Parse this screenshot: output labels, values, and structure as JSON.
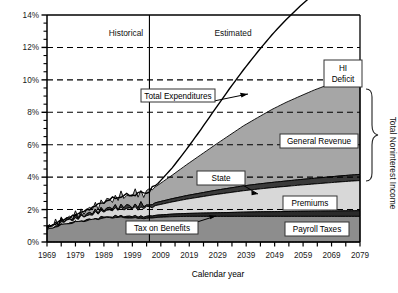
{
  "chart_data": {
    "type": "area",
    "title": "",
    "xlabel": "Calendar year",
    "ylabel": "",
    "xlim": [
      1969,
      2079
    ],
    "ylim": [
      0,
      14
    ],
    "ytick_labels": [
      "0%",
      "2%",
      "4%",
      "6%",
      "8%",
      "10%",
      "12%",
      "14%"
    ],
    "ytick_values": [
      0,
      2,
      4,
      6,
      8,
      10,
      12,
      14
    ],
    "yminor_step": 0.5,
    "xtick_labels": [
      "1969",
      "1979",
      "1989",
      "1999",
      "2009",
      "2019",
      "2029",
      "2039",
      "2049",
      "2059",
      "2069",
      "2079"
    ],
    "xtick_values": [
      1969,
      1979,
      1989,
      1999,
      2009,
      2019,
      2029,
      2039,
      2049,
      2059,
      2069,
      2079
    ],
    "xminor_step": 5,
    "grid": "horizontal-dashed",
    "legend_position": "inline-callouts",
    "divider_year": 2005,
    "periods": [
      {
        "label": "Historical",
        "x": 1987
      },
      {
        "label": "Estimated",
        "x": 2022
      }
    ],
    "x": [
      1969,
      1974,
      1979,
      1984,
      1989,
      1994,
      1999,
      2004,
      2008,
      2013,
      2018,
      2023,
      2028,
      2033,
      2038,
      2043,
      2048,
      2053,
      2058,
      2063,
      2068,
      2073,
      2079
    ],
    "series": [
      {
        "name": "Payroll Taxes",
        "kind": "stacked-area",
        "color": "#8d8d8d",
        "values": [
          0.75,
          1.05,
          1.22,
          1.35,
          1.48,
          1.52,
          1.48,
          1.45,
          1.52,
          1.56,
          1.58,
          1.58,
          1.58,
          1.58,
          1.58,
          1.58,
          1.58,
          1.58,
          1.58,
          1.58,
          1.58,
          1.58,
          1.58
        ]
      },
      {
        "name": "Tax on Benefits",
        "kind": "stacked-area",
        "color": "#2a2a2a",
        "values": [
          0.0,
          0.0,
          0.0,
          0.02,
          0.05,
          0.07,
          0.1,
          0.12,
          0.14,
          0.16,
          0.18,
          0.2,
          0.22,
          0.24,
          0.26,
          0.28,
          0.29,
          0.3,
          0.31,
          0.32,
          0.33,
          0.34,
          0.35
        ]
      },
      {
        "name": "Premiums",
        "kind": "stacked-area",
        "color": "#d8d8d8",
        "values": [
          0.1,
          0.16,
          0.22,
          0.3,
          0.38,
          0.45,
          0.5,
          0.55,
          0.62,
          0.75,
          0.88,
          1.0,
          1.12,
          1.22,
          1.32,
          1.4,
          1.48,
          1.55,
          1.62,
          1.68,
          1.74,
          1.8,
          1.86
        ]
      },
      {
        "name": "State",
        "kind": "stacked-area",
        "color": "#3a3a3a",
        "values": [
          0.04,
          0.06,
          0.08,
          0.1,
          0.12,
          0.14,
          0.15,
          0.16,
          0.18,
          0.2,
          0.22,
          0.24,
          0.26,
          0.28,
          0.3,
          0.31,
          0.32,
          0.33,
          0.34,
          0.35,
          0.36,
          0.37,
          0.38
        ]
      },
      {
        "name": "General Revenue",
        "kind": "stacked-area",
        "color": "#a6a6a6",
        "values": [
          0.0,
          0.05,
          0.15,
          0.28,
          0.45,
          0.6,
          0.7,
          0.78,
          1.05,
          1.45,
          1.9,
          2.35,
          2.8,
          3.25,
          3.7,
          4.1,
          4.5,
          4.85,
          5.15,
          5.45,
          5.7,
          5.95,
          6.2
        ]
      },
      {
        "name": "HI Deficit",
        "kind": "gap-to-total",
        "color": "#ffffff",
        "values": [
          0.0,
          0.0,
          0.0,
          0.0,
          0.0,
          0.0,
          0.0,
          0.0,
          0.1,
          0.45,
          0.95,
          1.55,
          2.2,
          2.85,
          3.45,
          4.05,
          4.6,
          5.1,
          5.55,
          5.95,
          6.3,
          6.6,
          6.85
        ]
      },
      {
        "name": "Total Expenditures",
        "kind": "line",
        "color": "#000000",
        "values": [
          0.89,
          1.32,
          1.67,
          2.05,
          2.48,
          2.78,
          2.93,
          3.06,
          3.61,
          4.57,
          5.71,
          6.92,
          8.18,
          9.42,
          10.61,
          11.72,
          12.77,
          13.71,
          14.55,
          15.33,
          16.01,
          16.64,
          17.22
        ]
      }
    ],
    "annotations": [
      {
        "name": "total-expenditures",
        "label": "Total Expenditures",
        "has_arrow": true
      },
      {
        "name": "hi-deficit",
        "label_lines": [
          "HI",
          "Deficit"
        ],
        "has_arrow": false
      },
      {
        "name": "general-revenue",
        "label": "General Revenue",
        "has_arrow": false
      },
      {
        "name": "state",
        "label": "State",
        "has_arrow": true
      },
      {
        "name": "premiums",
        "label": "Premiums",
        "has_arrow": false
      },
      {
        "name": "tax-on-benefits",
        "label": "Tax on Benefits",
        "has_arrow": true
      },
      {
        "name": "payroll-taxes",
        "label": "Payroll Taxes",
        "has_arrow": false
      }
    ],
    "brace": {
      "label": "Total Noninterest Income"
    }
  },
  "axis": {
    "x_title": "Calendar year",
    "y_ticks": [
      "14%",
      "12%",
      "10%",
      "8%",
      "6%",
      "4%",
      "2%",
      "0%"
    ],
    "x_ticks": [
      "1969",
      "1979",
      "1989",
      "1999",
      "2009",
      "2019",
      "2029",
      "2039",
      "2049",
      "2059",
      "2069",
      "2079"
    ]
  },
  "periods": {
    "historical": "Historical",
    "estimated": "Estimated"
  },
  "callouts": {
    "total_expenditures": "Total Expenditures",
    "hi_line1": "HI",
    "hi_line2": "Deficit",
    "general_revenue": "General Revenue",
    "state": "State",
    "premiums": "Premiums",
    "tax_on_benefits": "Tax on Benefits",
    "payroll_taxes": "Payroll Taxes"
  },
  "brace": {
    "label": "Total Noninterest Income"
  },
  "colors": {
    "payroll_taxes": "#8d8d8d",
    "tax_on_benefits": "#2a2a2a",
    "premiums": "#d8d8d8",
    "state": "#3a3a3a",
    "general_revenue": "#a6a6a6",
    "hi_deficit": "#ffffff",
    "total_expenditures_line": "#000000",
    "axis": "#000000",
    "grid": "#000000"
  }
}
